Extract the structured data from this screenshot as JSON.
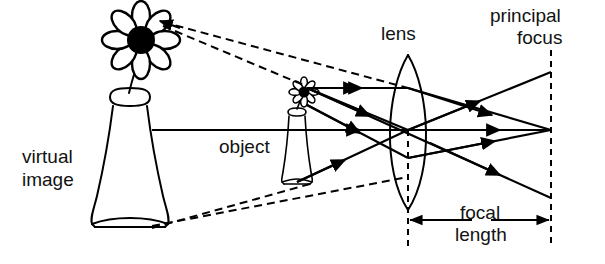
{
  "figure": {
    "type": "optics-ray-diagram",
    "background_color": "#ffffff",
    "line_color": "#000000",
    "width": 605,
    "height": 264
  },
  "labels": {
    "virtual_image_line1": "virtual",
    "virtual_image_line2": "image",
    "object": "object",
    "lens": "lens",
    "principal_focus_line1": "principal",
    "principal_focus_line2": "focus",
    "focal_length_line1": "focal",
    "focal_length_line2": "length"
  },
  "elements": {
    "virtual_image_object": "large-flower-in-vase",
    "real_object": "small-flower-in-vase",
    "lens_shape": "biconvex-converging-lens",
    "optical_axis": "horizontal-principal-axis",
    "focus_marker": "dashed-vertical-line-at-principal-focus",
    "focal_length_measure": "double-headed-arrow",
    "construction_rays": "dashed-backward-extension-lines",
    "light_rays": "solid-arrowed-rays"
  },
  "geometry": {
    "lens_center_x": 408,
    "axis_y": 130,
    "focus_x": 551,
    "focal_length_px": 143,
    "object_x": 297,
    "virtual_image_x": 130
  }
}
